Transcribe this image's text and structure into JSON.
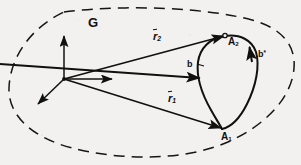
{
  "figure": {
    "background_color": "#f2f1ef",
    "ink_color": "#101010"
  },
  "labels": {
    "region": "G",
    "vector_2_symbol": "r",
    "vector_2_subscript": "2",
    "vector_1_symbol": "r",
    "vector_1_subscript": "1",
    "point_2_symbol": "A",
    "point_2_subscript": "2",
    "point_1_symbol": "A",
    "point_1_subscript": "1",
    "contour": "b",
    "contour_star_symbol": "b",
    "contour_star_superscript": "*"
  },
  "elements": {
    "region_boundary": "dashed-closed-curve",
    "coordinate_frame": "three-axis-origin-frame",
    "axis_up": "vertical-axis-arrow",
    "axis_right": "horizontal-axis-arrow",
    "axis_down_left": "oblique-axis-arrow",
    "vector_r2": "arrow-origin-to-A2",
    "vector_r1": "arrow-origin-to-A1",
    "closed_contour": "teardrop-closed-curve",
    "contour_arrow_left": "downward-direction-arrowhead",
    "contour_arrow_right": "upward-direction-arrowhead",
    "leader_line_b": "label-leader-line"
  },
  "geometry": {
    "origin": [
      64,
      79
    ],
    "point_A1": [
      222,
      128
    ],
    "point_A2": [
      225,
      36
    ]
  }
}
